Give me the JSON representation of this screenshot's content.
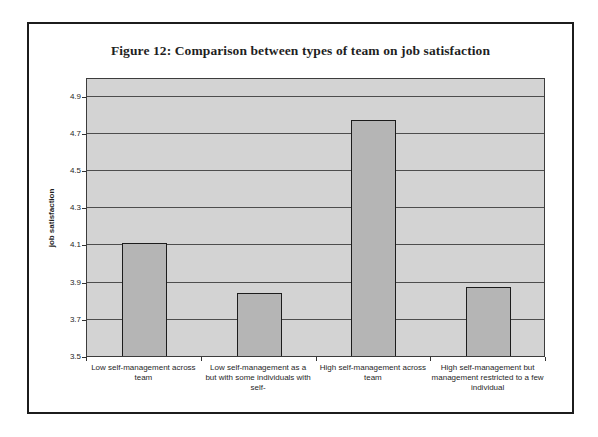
{
  "chart_data": {
    "type": "bar",
    "title": "Figure 12: Comparison between types of team on job satisfaction",
    "xlabel": "",
    "ylabel": "job satisfaction",
    "categories": [
      "Low self-management across team",
      "Low self-management as a but with some individuals with self-",
      "High self-management across team",
      "High self-management but management restricted to a few individual"
    ],
    "category_lines": [
      [
        "Low self-management across",
        "team"
      ],
      [
        "Low self-management as a",
        "but with some individuals with",
        "self-"
      ],
      [
        "High self-management across",
        "team"
      ],
      [
        "High self-management but",
        "management restricted to a few",
        "individual"
      ]
    ],
    "values": [
      4.11,
      3.84,
      4.77,
      3.87
    ],
    "ylim": [
      3.5,
      5.0
    ],
    "yticks": [
      3.5,
      3.7,
      3.9,
      4.1,
      4.3,
      4.5,
      4.7,
      4.9
    ],
    "ytick_decimals": 1,
    "grid": true,
    "legend": "none",
    "bar_width_px": 45,
    "colors": {
      "page_bg": "#ffffff",
      "figure_border": "#1c1c1c",
      "plot_bg": "#d3d3d3",
      "plot_border": "#3c3c3c",
      "gridline": "#4d4d4d",
      "bar_fill": "#b5b5b5",
      "bar_border": "#1c1c1c",
      "tick": "#333333",
      "text": "#1f1f1f"
    }
  }
}
